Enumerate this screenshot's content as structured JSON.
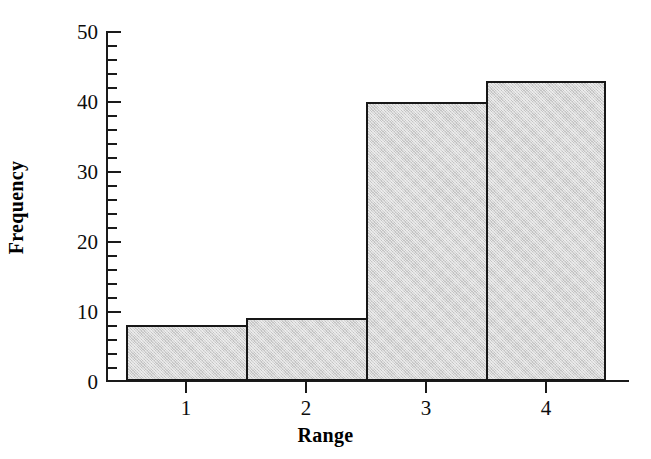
{
  "chart_data": {
    "type": "bar",
    "title": "",
    "subtitle": "",
    "xlabel": "Range",
    "ylabel": "Frequency",
    "categories": [
      "1",
      "2",
      "3",
      "4"
    ],
    "values": [
      8,
      9,
      40,
      43
    ],
    "series": [
      {
        "name": "Frequency",
        "values": [
          8,
          9,
          40,
          43
        ]
      }
    ],
    "ylim": [
      0,
      50
    ],
    "xlim": [
      0.5,
      4.5
    ],
    "y_major_ticks": [
      0,
      10,
      20,
      30,
      40,
      50
    ],
    "y_minor_tick_interval": 2,
    "y_tick_labels": [
      "0",
      "10",
      "20",
      "30",
      "40",
      "50"
    ],
    "x_tick_labels": [
      "1",
      "2",
      "3",
      "4"
    ],
    "grid": false,
    "legend": false,
    "legend_position": "none",
    "bar_style": "contiguous-histogram",
    "colors": {
      "bar_fill": "#d5d5d5",
      "bar_edge": "#171717",
      "axis": "#1a1a1a",
      "text": "#0d0d0d",
      "background": "#ffffff"
    }
  }
}
